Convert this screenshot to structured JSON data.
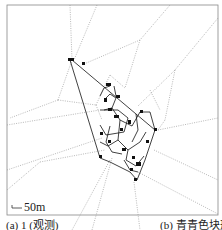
{
  "figure": {
    "scale_bar_label": "50m",
    "caption_left": "(a) 1 (观测)",
    "caption_right": "(b) 青青色块形",
    "colors": {
      "frame": "#888888",
      "voronoi_lines": "#9a9a9a",
      "network": "#111111",
      "background": "#ffffff"
    }
  }
}
